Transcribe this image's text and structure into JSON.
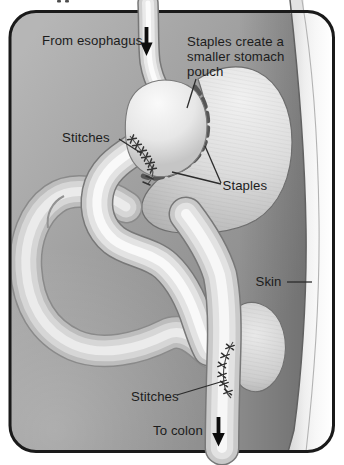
{
  "figure": {
    "labels": {
      "from_esophagus": "From esophagus",
      "pouch_note_line1": "Staples create a",
      "pouch_note_line2": "smaller stomach",
      "pouch_note_line3": "pouch",
      "stitches_upper": "Stitches",
      "staples": "Staples",
      "skin": "Skin",
      "stitches_lower": "Stitches",
      "to_colon": "To colon"
    },
    "icons": {
      "top_arrow": "down-arrow",
      "bottom_arrow": "down-arrow"
    },
    "colors": {
      "page_background": "#ffffff",
      "frame_border": "#1a1a1a",
      "cavity_background": "#9e9e9e",
      "organ_highlight": "#f9f9f9",
      "organ_base": "#c6c6c6",
      "organ_outline": "#6e6e6e",
      "staple_dash": "#565656",
      "stitch": "#333333",
      "skin_band": "#f2f2f2",
      "label_text": "#1c1c1c",
      "arrow": "#0d0d0d"
    }
  }
}
